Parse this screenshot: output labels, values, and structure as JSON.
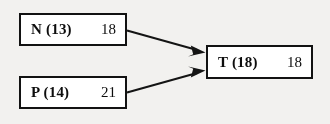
{
  "diagram": {
    "type": "node-flow-diagram",
    "background_color": "#f2f1ef",
    "line_color": "#141414",
    "box_fill_color": "#ffffff",
    "nodes": [
      {
        "id": "n",
        "label": "N (13)",
        "value": "18",
        "position": "top-left"
      },
      {
        "id": "p",
        "label": "P (14)",
        "value": "21",
        "position": "bottom-left"
      },
      {
        "id": "t",
        "label": "T (18)",
        "value": "18",
        "position": "right"
      }
    ],
    "edges": [
      {
        "id": "edge-n-to-t",
        "from": "n",
        "to": "t",
        "arrowhead": "filled-triangle"
      },
      {
        "id": "edge-p-to-t",
        "from": "p",
        "to": "t",
        "arrowhead": "filled-triangle"
      }
    ]
  }
}
